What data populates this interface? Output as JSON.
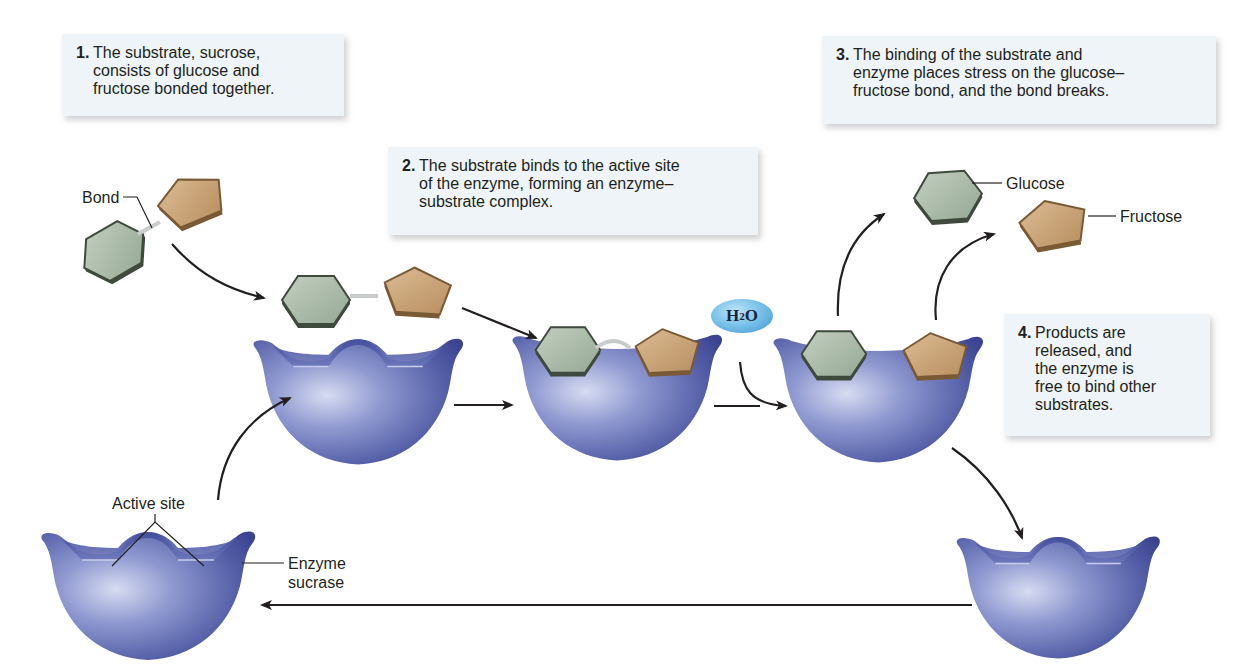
{
  "diagram": {
    "colors": {
      "glucose": "#a9b9a8",
      "glucose_edge": "#3e4a3c",
      "fructose": "#c9a57c",
      "fructose_edge": "#7a5a35",
      "enzyme": "#7b86c4",
      "enzyme_dark": "#3e4691",
      "note_background": "#eef4f7",
      "water": "#6cb8e6"
    },
    "steps": [
      {
        "number": "1.",
        "text": "The substrate, sucrose,\nconsists of glucose and\nfructose bonded together."
      },
      {
        "number": "2.",
        "text": "The substrate binds to the active site\nof the enzyme, forming an enzyme–\nsubstrate complex."
      },
      {
        "number": "3.",
        "text": "The binding of the substrate and\nenzyme places stress on the glucose–\nfructose bond, and the bond breaks."
      },
      {
        "number": "4.",
        "text": "Products are\nreleased, and\nthe enzyme is\nfree to bind other\nsubstrates."
      }
    ],
    "labels": {
      "bond": "Bond",
      "glucose": "Glucose",
      "fructose": "Fructose",
      "active_site": "Active site",
      "enzyme": "Enzyme\nsucrase",
      "water_main": "H",
      "water_sub": "2",
      "water_end": "O"
    },
    "nodes": [
      "sucrose-substrate",
      "free-enzyme",
      "substrate-approaching-enzyme",
      "enzyme-substrate-complex",
      "enzyme-with-split-products",
      "released-glucose",
      "released-fructose",
      "recycled-enzyme",
      "starting-enzyme-sucrase"
    ]
  }
}
